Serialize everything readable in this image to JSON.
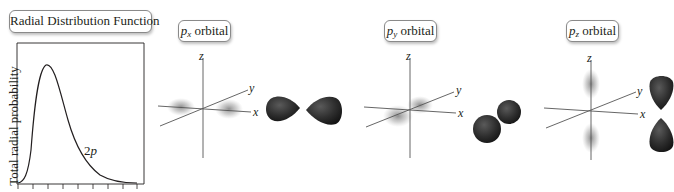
{
  "panels": {
    "radial": {
      "title": "Radial Distribution Function",
      "ylabel": "Total radial probability",
      "curve_label_num": "2",
      "curve_label_letter": "p"
    },
    "px": {
      "letter": "p",
      "subscript": "x",
      "suffix": " orbital"
    },
    "py": {
      "letter": "p",
      "subscript": "y",
      "suffix": " orbital"
    },
    "pz": {
      "letter": "p",
      "subscript": "z",
      "suffix": " orbital"
    }
  },
  "axes": {
    "x": "x",
    "y": "y",
    "z": "z"
  },
  "colors": {
    "ink": "#231f20",
    "lobe": "#2b2b2b",
    "frame": "#8a8a8a"
  }
}
